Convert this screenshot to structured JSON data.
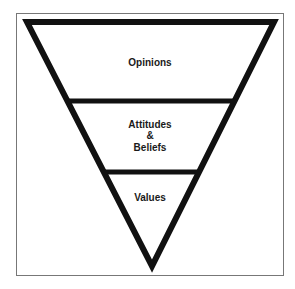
{
  "diagram": {
    "type": "inverted-pyramid",
    "colors": {
      "stroke": "#111111",
      "frame": "#777777",
      "text": "#1a1a1a",
      "background": "#ffffff"
    },
    "layers": [
      {
        "lines": [
          "Opinions"
        ]
      },
      {
        "lines": [
          "Attitudes",
          "&",
          "Beliefs"
        ]
      },
      {
        "lines": [
          "Values"
        ]
      }
    ]
  }
}
